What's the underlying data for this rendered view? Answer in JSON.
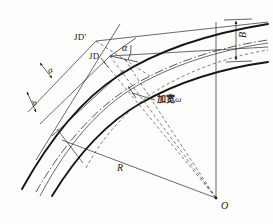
{
  "figure": {
    "type": "engineering-diagram",
    "background_color": "#fdfdfc",
    "ink_color": "#1b1b1b"
  },
  "labels": {
    "jd_prime": "JD'",
    "jd": "JD",
    "alpha_main": "α",
    "alpha_left": "α",
    "b_left": "b",
    "width_B": "B",
    "radius_R": "R",
    "center_O": "O",
    "widening_text": "加宽",
    "widening_symbol": "ω"
  },
  "geometry": {
    "center_point": {
      "x": 216,
      "y": 198
    },
    "radius_line": {
      "from": {
        "x": 62,
        "y": 140
      },
      "to": {
        "x": 216,
        "y": 198
      }
    },
    "vertical_radius": {
      "from": {
        "x": 216,
        "y": 50
      },
      "to": {
        "x": 216,
        "y": 198
      }
    },
    "intersection_points": {
      "jd_prime": {
        "x": 96,
        "y": 41
      },
      "jd": {
        "x": 110,
        "y": 56
      }
    },
    "dimension_B": {
      "x": 230,
      "top_y": 20,
      "bottom_y": 62,
      "between": "outer edge and centerline"
    }
  },
  "line_styles": {
    "road_edge": "solid-thick",
    "tangent": "solid-thin",
    "centerline": "dash-dot",
    "construction": "dashed"
  }
}
